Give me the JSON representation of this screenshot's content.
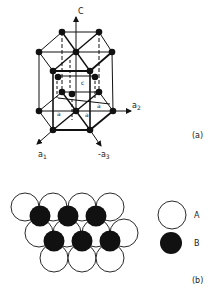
{
  "figure_a": {
    "label": "(a)",
    "axes": {
      "c": "C",
      "a1": "a",
      "a1_sub": "1",
      "a2": "a",
      "a2_sub": "2",
      "neg_a3": "-a",
      "neg_a3_sub": "3"
    },
    "dimension_labels": {
      "c_param": "c",
      "a_param_1": "a",
      "a_param_2": "a",
      "a_param_3": "a"
    }
  },
  "figure_b": {
    "label": "(b)",
    "legend": [
      {
        "symbol": "open-circle",
        "label": "A"
      },
      {
        "symbol": "filled-circle",
        "label": "B"
      }
    ]
  },
  "colors": {
    "line": "#111111",
    "atom_fill": "#111111",
    "background": "#ffffff"
  }
}
